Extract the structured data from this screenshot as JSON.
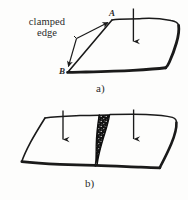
{
  "figure": {
    "background_color": "#fdfdfc",
    "ink_color": "#1a1a1a",
    "annotation": {
      "clamped_edge_line1": "clamped",
      "clamped_edge_line2": "edge"
    },
    "points": {
      "a": "A",
      "b": "B"
    },
    "panels": [
      {
        "caption": "a)",
        "description": "flat plate with clamped edge and downward load arrow"
      },
      {
        "caption": "b)",
        "description": "split plate with dark wedge crack and two downward load arrows"
      }
    ]
  },
  "captions": {
    "panel_a": "a)",
    "panel_b": "b)"
  },
  "labels": {
    "clamped_line1": "clamped",
    "clamped_line2": "edge",
    "vertex_a": "A",
    "vertex_b": "B"
  }
}
